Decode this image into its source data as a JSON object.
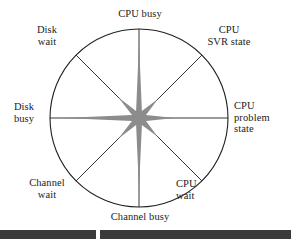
{
  "figure": {
    "type": "kiviat-radar-chart",
    "title": "",
    "center": {
      "x": 139,
      "y": 118
    },
    "radius": 89,
    "circle_color": "#1f1f1f",
    "spoke_color": "#1f1f1f",
    "fill_color": "#8c8c8c",
    "background": "#ffffff"
  },
  "chart_data": {
    "type": "line",
    "subtype": "radar",
    "title": "",
    "xlabel": "",
    "ylabel": "",
    "grid": false,
    "legend": "none",
    "axis_range": [
      0,
      1
    ],
    "categories": [
      "CPU busy",
      "CPU SVR state",
      "CPU problem state",
      "CPU wait",
      "Channel busy",
      "Channel wait",
      "Disk busy",
      "Disk wait"
    ],
    "angles_deg": [
      90,
      45,
      0,
      315,
      270,
      225,
      180,
      135
    ],
    "series": [
      {
        "name": "utilization",
        "values": [
          0.85,
          0.3,
          0.4,
          0.3,
          0.8,
          0.33,
          0.85,
          0.33
        ]
      }
    ]
  },
  "labels": {
    "cpu_busy": "CPU busy",
    "cpu_svr_state": "CPU\nSVR state",
    "cpu_problem_state": "CPU\nproblem\nstate",
    "cpu_wait": "CPU\nwait",
    "channel_busy": "Channel busy",
    "channel_wait": "Channel\nwait",
    "disk_busy": "Disk\nbusy",
    "disk_wait": "Disk\nwait"
  }
}
